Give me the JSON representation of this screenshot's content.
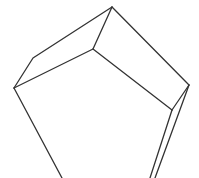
{
  "document": {
    "title": "Open Box Line Drawing",
    "background_color": "#ffffff",
    "width": 199,
    "height": 178
  },
  "figure": {
    "name": "open-cardboard-box-wireframe",
    "stroke_color": "#333333",
    "stroke_width": 1.3,
    "fill_color": "#ffffff",
    "vertices": {
      "apex": [
        112,
        7
      ],
      "left_outer": [
        14,
        88
      ],
      "left_bend": [
        33,
        58
      ],
      "right_outer": [
        189,
        85
      ],
      "inner_left": [
        93,
        49
      ],
      "inner_right": [
        172,
        110
      ],
      "bottom_left_exit": [
        62,
        178
      ],
      "bottom_right_exit_a": [
        155,
        178
      ],
      "bottom_right_exit_b": [
        150,
        178
      ]
    },
    "paths": [
      {
        "name": "left-flap-outer-edge",
        "d": "M 112 7 L 33 58 L 14 88"
      },
      {
        "name": "left-flap-inner-edge",
        "d": "M 112 7 L 93 49 L 14 88"
      },
      {
        "name": "right-flap-outer-edge",
        "d": "M 112 7 L 189 85"
      },
      {
        "name": "right-flap-inner-edge",
        "d": "M 93 49 L 172 110"
      },
      {
        "name": "right-flap-end-edge",
        "d": "M 189 85 L 172 110"
      },
      {
        "name": "front-left-edge",
        "d": "M 14 88 L 62 178"
      },
      {
        "name": "front-right-edge-outer",
        "d": "M 189 85 L 155 178"
      },
      {
        "name": "front-right-edge-inner",
        "d": "M 172 110 L 150 178"
      }
    ]
  }
}
